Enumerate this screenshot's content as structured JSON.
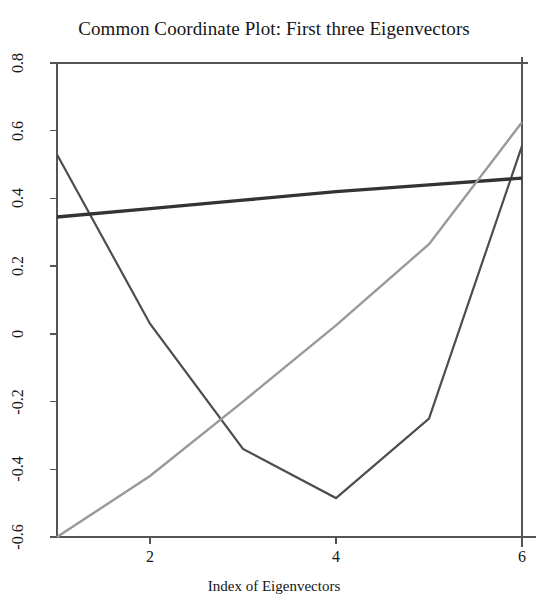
{
  "chart_data": {
    "type": "line",
    "title": "Common Coordinate Plot: First three Eigenvectors",
    "xlabel": "Index of Eigenvectors",
    "ylabel": "",
    "x": [
      1,
      2,
      3,
      4,
      5,
      6
    ],
    "xlim": [
      1,
      6
    ],
    "ylim": [
      -0.6,
      0.8
    ],
    "xticks": [
      2,
      4,
      6
    ],
    "xtick_labels": [
      "2",
      "4",
      "6"
    ],
    "yticks": [
      0.8,
      0.6,
      0.4,
      0.2,
      0,
      -0.2,
      -0.4,
      -0.6
    ],
    "ytick_labels": [
      "0.8",
      "0.6",
      "0.4",
      "0.2",
      "0",
      "-0.2",
      "-0.4",
      "-0.6"
    ],
    "grid": false,
    "legend": "none",
    "series": [
      {
        "name": "eigenvector-1",
        "color": "#4d4d4d",
        "width": 2.2,
        "values": [
          0.53,
          0.03,
          -0.34,
          -0.485,
          -0.25,
          0.555
        ]
      },
      {
        "name": "eigenvector-2",
        "color": "#333333",
        "width": 3.4,
        "values": [
          0.345,
          0.37,
          0.395,
          0.42,
          0.44,
          0.46
        ]
      },
      {
        "name": "eigenvector-3",
        "color": "#999999",
        "width": 2.4,
        "values": [
          -0.6,
          -0.42,
          -0.2,
          0.025,
          0.265,
          0.625
        ]
      }
    ],
    "axis_color": "#555555"
  }
}
